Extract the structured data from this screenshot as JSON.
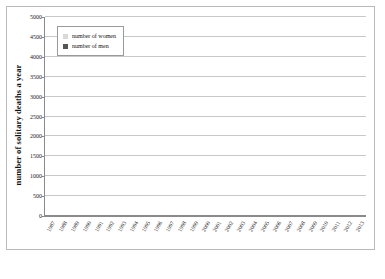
{
  "chart_data": {
    "type": "bar",
    "subtype": "stacked-vertical",
    "title": "",
    "xlabel": "",
    "ylabel": "number of solitary deaths a year",
    "ylim": [
      0,
      5000
    ],
    "ytick_step": 500,
    "yticks": [
      0,
      500,
      1000,
      1500,
      2000,
      2500,
      3000,
      3500,
      4000,
      4500,
      5000
    ],
    "ytick_labels": [
      "0",
      "500",
      "1000",
      "1500",
      "2000",
      "2500",
      "3000",
      "3500",
      "4000",
      "4500",
      "5000"
    ],
    "grid": true,
    "legend_position": "top-left",
    "categories": [
      "1987",
      "1988",
      "1989",
      "1990",
      "1991",
      "1992",
      "1993",
      "1994",
      "1995",
      "1996",
      "1997",
      "1998",
      "1999",
      "2000",
      "2001",
      "2002",
      "2003",
      "2004",
      "2005",
      "2006",
      "2007",
      "2008",
      "2009",
      "2010",
      "2011",
      "2012",
      "2013"
    ],
    "series": [
      {
        "name": "number of men",
        "color": "#565656",
        "values": [
          780,
          750,
          840,
          880,
          940,
          1010,
          1090,
          1190,
          1240,
          1210,
          1250,
          1610,
          1820,
          1650,
          1800,
          1860,
          1970,
          2070,
          2330,
          2340,
          2580,
          2550,
          2690,
          3110,
          3070,
          3030,
          3060
        ]
      },
      {
        "name": "number of women",
        "color": "#d9d9d9",
        "values": [
          330,
          330,
          360,
          370,
          460,
          470,
          540,
          580,
          620,
          590,
          640,
          700,
          770,
          760,
          790,
          790,
          870,
          950,
          1020,
          1040,
          1340,
          1200,
          1160,
          1540,
          1410,
          1400,
          1430
        ]
      }
    ],
    "totals": [
      1110,
      1080,
      1200,
      1250,
      1400,
      1480,
      1630,
      1770,
      1860,
      1800,
      1890,
      2310,
      2590,
      2410,
      2590,
      2650,
      2840,
      3020,
      3350,
      3380,
      3920,
      3750,
      3850,
      4650,
      4480,
      4430,
      4490
    ]
  },
  "legend": {
    "items": [
      {
        "label": "number of women",
        "swatch": "women"
      },
      {
        "label": "number of men",
        "swatch": "men"
      }
    ]
  }
}
